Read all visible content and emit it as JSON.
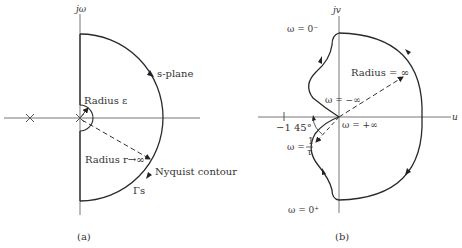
{
  "figure_a": {
    "caption": "(a)",
    "axis_label_vertical": "jω",
    "plane_label": "s-plane",
    "small_radius_label": "Radius ε",
    "large_radius_label": "Radius r→∞",
    "contour_label": "Nyquist contour",
    "contour_symbol": "Γs",
    "poles": [
      "pole at -a (×)",
      "pole at origin (×)"
    ]
  },
  "figure_b": {
    "caption": "(b)",
    "axis_label_vertical": "jv",
    "axis_label_horizontal": "u",
    "omega_0_minus": "ω = 0⁻",
    "omega_0_plus": "ω = 0⁺",
    "omega_neg_inf": "ω = −∞",
    "omega_pos_inf": "ω = +∞",
    "omega_one_over_tau_prefix": "ω =",
    "omega_one_over_tau_num": "1",
    "omega_one_over_tau_den": "τ",
    "minus_one": "−1",
    "angle": "45°",
    "radius_label": "Radius = ∞"
  },
  "colors": {
    "stroke": "#2a2a2a",
    "axis": "#555555",
    "text": "#333333"
  }
}
